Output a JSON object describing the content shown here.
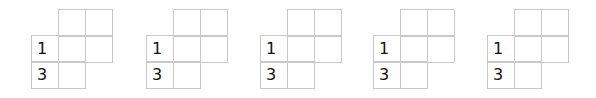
{
  "puzzles": [
    {
      "clues": {
        "r1c0": "1",
        "r2c0": "3"
      }
    },
    {
      "clues": {
        "r1c0": "1",
        "r2c0": "3"
      }
    },
    {
      "clues": {
        "r1c0": "1",
        "r2c0": "3"
      }
    },
    {
      "clues": {
        "r1c0": "1",
        "r2c0": "3"
      }
    },
    {
      "clues": {
        "r1c0": "1",
        "r2c0": "3"
      }
    }
  ],
  "style": {
    "line_color": "#c9c9c9",
    "digit_color": "#111111"
  }
}
